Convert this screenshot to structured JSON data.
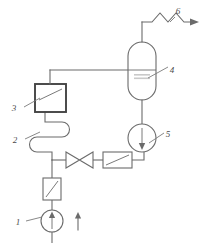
{
  "diagram": {
    "background_color": "#ffffff",
    "line_color": "#6b6b6b",
    "label_color": "#4a4a4a",
    "width": 204,
    "height": 243,
    "callouts": [
      {
        "id": "1",
        "label": "1",
        "refers_to": "feed-pump",
        "x": 18,
        "y": 222
      },
      {
        "id": "2",
        "label": "2",
        "refers_to": "serpentine-coil",
        "x": 15,
        "y": 140
      },
      {
        "id": "3",
        "label": "3",
        "refers_to": "heat-exchanger-box",
        "x": 14,
        "y": 108
      },
      {
        "id": "4",
        "label": "4",
        "refers_to": "separator-vessel",
        "x": 172,
        "y": 70
      },
      {
        "id": "5",
        "label": "5",
        "refers_to": "circulation-pump",
        "x": 168,
        "y": 134
      },
      {
        "id": "6",
        "label": "6",
        "refers_to": "product-outlet-line",
        "x": 178,
        "y": 16
      }
    ],
    "equipment": [
      {
        "name": "feed-pump",
        "type": "pump-circle-up-arrow",
        "callout": "1"
      },
      {
        "name": "inlet-filter",
        "type": "rectangle-with-diagonal",
        "callout": null
      },
      {
        "name": "serpentine-coil",
        "type": "coil",
        "callout": "2"
      },
      {
        "name": "heat-exchanger-box",
        "type": "square-with-diagonal",
        "callout": "3"
      },
      {
        "name": "separator-vessel",
        "type": "vertical-capsule-vessel",
        "callout": "4"
      },
      {
        "name": "circulation-pump",
        "type": "pump-circle-down-arrow",
        "callout": "5"
      },
      {
        "name": "gate-valve",
        "type": "bowtie-valve",
        "callout": null
      },
      {
        "name": "flow-element",
        "type": "rectangle-with-diagonal",
        "callout": null
      },
      {
        "name": "product-outlet-line",
        "type": "zigzag-line-with-arrow",
        "callout": "6"
      },
      {
        "name": "feed-inlet-arrow",
        "type": "up-arrow",
        "callout": null
      }
    ]
  }
}
